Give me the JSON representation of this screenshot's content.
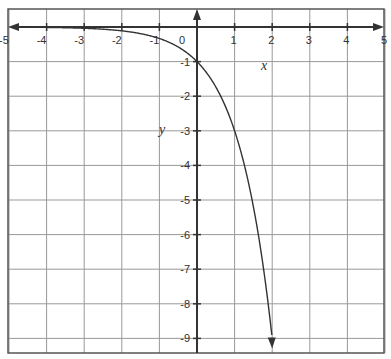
{
  "chart_data": {
    "type": "line",
    "title": "",
    "function": "y = -3^x",
    "xlabel": "x",
    "ylabel": "y",
    "xlim": [
      -5,
      5
    ],
    "ylim": [
      -9.45,
      0.55
    ],
    "grid": true,
    "x_ticks": [
      -5,
      -4,
      -3,
      -2,
      -1,
      0,
      1,
      2,
      3,
      4,
      5
    ],
    "x_tick_labels": [
      "-5",
      "-4",
      "-3",
      "-2",
      "-1",
      "0",
      "1",
      "2",
      "3",
      "4",
      "5"
    ],
    "y_ticks": [
      -1,
      -2,
      -3,
      -4,
      -5,
      -6,
      -7,
      -8,
      -9
    ],
    "y_tick_labels": [
      "-1",
      "-2",
      "-3",
      "-4",
      "-5",
      "-6",
      "-7",
      "-8",
      "-9"
    ],
    "series": [
      {
        "name": "y = -3^x",
        "x": [
          -5,
          -4,
          -3,
          -2,
          -1,
          0,
          1,
          2
        ],
        "y": [
          -0.004,
          -0.012,
          -0.037,
          -0.111,
          -0.333,
          -1,
          -3,
          -9
        ]
      }
    ],
    "annotations": [
      "arrow on left end of curve (asymptote y=0)",
      "arrow on lower end of curve at x=2, y=-9"
    ],
    "colors": {
      "curve": "#333333",
      "axes": "#333333",
      "grid": "#999999",
      "frame": "#555555"
    }
  }
}
